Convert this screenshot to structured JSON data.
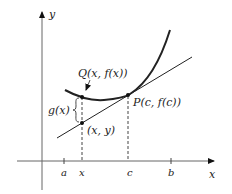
{
  "axes": {
    "x_label": "x",
    "y_label": "y"
  },
  "ticks": {
    "a": "a",
    "x": "x",
    "c": "c",
    "b": "b"
  },
  "points": {
    "Q": "Q(x, f(x))",
    "P": "P(c, f(c))",
    "line_point": "(x, y)"
  },
  "brace_label": "g(x)",
  "colors": {
    "ink": "#222222",
    "axis": "#555555",
    "background": "#ffffff"
  }
}
